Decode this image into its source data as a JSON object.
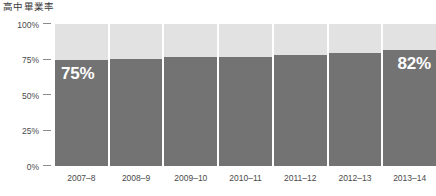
{
  "chart_data": {
    "type": "bar",
    "title": "高中畢業率",
    "xlabel": "",
    "ylabel": "",
    "categories": [
      "2007–8",
      "2008–9",
      "2009–10",
      "2010–11",
      "2011–12",
      "2012–13",
      "2013–14"
    ],
    "values": [
      75,
      75.5,
      76.5,
      77,
      78,
      79.5,
      82
    ],
    "value_labels": [
      "75%",
      "",
      "",
      "",
      "",
      "",
      "82%"
    ],
    "ylim": [
      0,
      100
    ],
    "ytick_labels": [
      "100%",
      "75%",
      "50%",
      "25%",
      "0%"
    ],
    "ytick_values": [
      100,
      75,
      50,
      25,
      0
    ],
    "grid": false,
    "legend": "none",
    "colors": {
      "bar_fill": "#737373",
      "bar_remainder": "#e2e2e2",
      "value_label": "#ffffff",
      "axis_text": "#4a4a4a",
      "title_text": "#3b3b3b",
      "tick_mark": "#8a8a8a",
      "background": "#ffffff"
    }
  }
}
